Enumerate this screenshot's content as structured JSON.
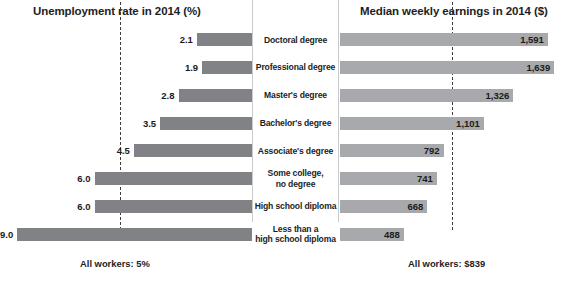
{
  "chart_data": {
    "type": "bar",
    "layout": "paired horizontal bar chart (diverging), shared category axis in center",
    "categories": [
      "Doctoral degree",
      "Professional degree",
      "Master's degree",
      "Bachelor's degree",
      "Associate's degree",
      "Some college,\nno degree",
      "High school diploma",
      "Less than a\nhigh school diploma"
    ],
    "series": [
      {
        "name": "Unemployment rate in 2014 (%)",
        "side": "left",
        "direction": "right-to-left",
        "unit": "%",
        "values": [
          2.1,
          1.9,
          2.8,
          3.5,
          4.5,
          6.0,
          6.0,
          9.0
        ],
        "labels": [
          "2.1",
          "1.9",
          "2.8",
          "3.5",
          "4.5",
          "6.0",
          "6.0",
          "9.0"
        ],
        "color": "#808285",
        "xlim": [
          0,
          9.6
        ],
        "reference_line": {
          "value": 5,
          "label": "All workers: 5%",
          "style": "dashed"
        }
      },
      {
        "name": "Median weekly earnings in 2014 ($)",
        "side": "right",
        "direction": "left-to-right",
        "unit": "$",
        "values": [
          1591,
          1639,
          1326,
          1101,
          792,
          741,
          668,
          488
        ],
        "labels": [
          "1,591",
          "1,639",
          "1,326",
          "1,101",
          "792",
          "741",
          "668",
          "488"
        ],
        "color": "#a7a9ac",
        "xlim": [
          0,
          1760
        ],
        "reference_line": {
          "value": 839,
          "label": "All workers: $839",
          "style": "dashed"
        }
      }
    ],
    "grid": false,
    "legend": "none",
    "axis_ticks": "none"
  },
  "titles": {
    "left": "Unemployment rate in 2014 (%)",
    "right": "Median weekly earnings in 2014 ($)"
  },
  "footers": {
    "left": "All workers: 5%",
    "right": "All workers: $839"
  },
  "rows": [
    {
      "category": "Doctoral degree",
      "unemployment": "2.1",
      "earnings": "1,591"
    },
    {
      "category": "Professional degree",
      "unemployment": "1.9",
      "earnings": "1,639"
    },
    {
      "category": "Master's degree",
      "unemployment": "2.8",
      "earnings": "1,326"
    },
    {
      "category": "Bachelor's degree",
      "unemployment": "3.5",
      "earnings": "1,101"
    },
    {
      "category": "Associate's degree",
      "unemployment": "4.5",
      "earnings": "792"
    },
    {
      "category": "Some college,\nno degree",
      "unemployment": "6.0",
      "earnings": "741"
    },
    {
      "category": "High school diploma",
      "unemployment": "6.0",
      "earnings": "668"
    },
    {
      "category": "Less than a\nhigh school diploma",
      "unemployment": "9.0",
      "earnings": "488"
    }
  ],
  "colors": {
    "unemployment_bar": "#808285",
    "earnings_bar": "#a7a9ac",
    "reference_line": "#3b3b3b",
    "text": "#221e1f"
  }
}
